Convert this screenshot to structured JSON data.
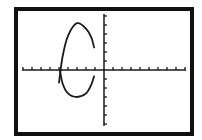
{
  "screen": {
    "background": "#ffffff",
    "frame_color": "#111111",
    "ink_color": "#1a1a1a"
  },
  "chart_data": {
    "type": "line",
    "title": "",
    "xlabel": "",
    "ylabel": "",
    "xlim": [
      -9,
      9
    ],
    "ylim": [
      -6,
      6
    ],
    "xscale": 1,
    "yscale": 1,
    "grid": false,
    "axes": true,
    "series": [
      {
        "name": "upper arc",
        "shape": "ellipse-arc",
        "center": [
          -3,
          1.1
        ],
        "rx": 2,
        "ry": 4.1,
        "points": [
          [
            -5,
            -1.4
          ],
          [
            -4.6,
            1.5
          ],
          [
            -4,
            3.8
          ],
          [
            -3,
            5.2
          ],
          [
            -2,
            4.6
          ],
          [
            -1.4,
            3.6
          ],
          [
            -1.1,
            2.5
          ]
        ]
      },
      {
        "name": "lower arc",
        "shape": "ellipse-arc",
        "center": [
          -3,
          1.1
        ],
        "rx": 2,
        "ry": 4.1,
        "points": [
          [
            -4.9,
            0.0
          ],
          [
            -4.6,
            -1.5
          ],
          [
            -4,
            -2.6
          ],
          [
            -3,
            -3.0
          ],
          [
            -2,
            -2.6
          ],
          [
            -1.4,
            -1.6
          ],
          [
            -1.1,
            -0.7
          ]
        ]
      }
    ]
  }
}
